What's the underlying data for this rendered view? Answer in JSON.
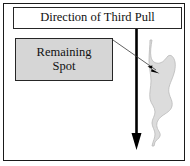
{
  "figure": {
    "title_box": {
      "label": "Direction of Third Pull"
    },
    "spot_label_box": {
      "line1": "Remaining",
      "line2": "Spot"
    },
    "annotations": {
      "pull_arrow_name": "direction-of-third-pull-arrow",
      "leader_line_name": "remaining-spot-leader-line",
      "spot_shape_name": "remaining-spot-shape"
    },
    "colors": {
      "frame": "#1a1a1a",
      "box_border": "#262626",
      "box_fill_gray": "#d6d6d6",
      "spot_fill": "#dcdcdc",
      "spot_outline": "#b8b8b8",
      "arrow": "#000000",
      "background": "#ffffff"
    }
  }
}
